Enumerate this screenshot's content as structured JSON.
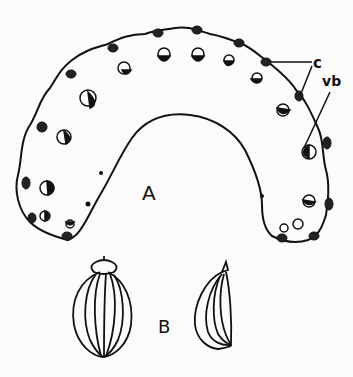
{
  "figure": {
    "part_a": {
      "label": "A",
      "description": "transverse section"
    },
    "part_b": {
      "label": "B",
      "description": "fruit views"
    },
    "annotations": [
      {
        "label": "c"
      },
      {
        "label": "vb"
      }
    ]
  },
  "colors": {
    "ink": "#111111",
    "background": "#fbfbf9"
  }
}
